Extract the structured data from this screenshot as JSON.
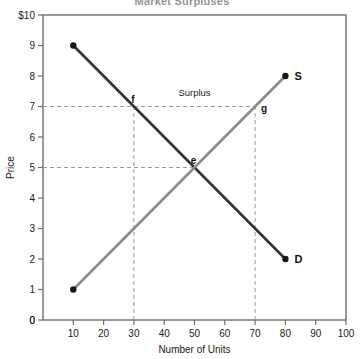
{
  "chart_data": {
    "type": "line",
    "title": "Market Surpluses",
    "xlabel": "Number of Units",
    "ylabel": "Price",
    "xlim": [
      0,
      100
    ],
    "ylim": [
      0,
      10
    ],
    "xticks": [
      "10",
      "20",
      "30",
      "40",
      "50",
      "60",
      "70",
      "80",
      "90",
      "100"
    ],
    "xtick_values": [
      10,
      20,
      30,
      40,
      50,
      60,
      70,
      80,
      90,
      100
    ],
    "x_origin_label": "0",
    "yticks": [
      "0",
      "1",
      "2",
      "3",
      "4",
      "5",
      "6",
      "7",
      "8",
      "9",
      "$10"
    ],
    "ytick_values": [
      0,
      1,
      2,
      3,
      4,
      5,
      6,
      7,
      8,
      9,
      10
    ],
    "grid": false,
    "legend": "none",
    "series": [
      {
        "name": "Demand",
        "label": "D",
        "color": "#333333",
        "endpoints": [
          [
            10,
            9
          ],
          [
            80,
            2
          ]
        ],
        "markers": [
          [
            10,
            9
          ],
          [
            80,
            2
          ]
        ]
      },
      {
        "name": "Supply",
        "label": "S",
        "color": "#8a8a8a",
        "endpoints": [
          [
            10,
            1
          ],
          [
            80,
            8
          ]
        ],
        "markers": [
          [
            10,
            1
          ],
          [
            80,
            8
          ]
        ]
      }
    ],
    "points": [
      {
        "id": "f",
        "label": "f",
        "x": 30,
        "y": 7,
        "curve": "Demand"
      },
      {
        "id": "e",
        "label": "e",
        "x": 50,
        "y": 5,
        "curve": "Equilibrium"
      },
      {
        "id": "g",
        "label": "g",
        "x": 70,
        "y": 7,
        "curve": "Supply"
      }
    ],
    "annotations": [
      {
        "id": "surplus",
        "text": "Surplus",
        "x": 50,
        "y": 7.35
      }
    ],
    "guide_lines": [
      {
        "id": "price-7",
        "orientation": "horizontal",
        "value": 7,
        "from": 0,
        "to": 70,
        "style": "dashed"
      },
      {
        "id": "price-5",
        "orientation": "horizontal",
        "value": 5,
        "from": 0,
        "to": 50,
        "style": "dashed"
      },
      {
        "id": "qty-30",
        "orientation": "vertical",
        "value": 30,
        "from": 0,
        "to": 7,
        "style": "dashed"
      },
      {
        "id": "qty-70",
        "orientation": "vertical",
        "value": 70,
        "from": 0,
        "to": 7,
        "style": "dashed"
      }
    ]
  }
}
